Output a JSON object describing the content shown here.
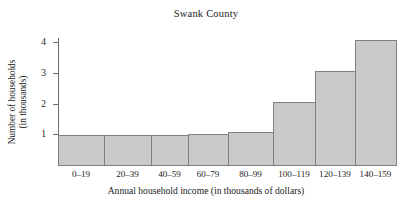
{
  "chart_data": {
    "type": "bar",
    "title": "Swank County",
    "xlabel": "Annual household income (in thousands of dollars)",
    "ylabel_line1": "Number of households",
    "ylabel_line2": "(in thousands)",
    "categories": [
      "0–19",
      "20–39",
      "40–59",
      "60–79",
      "80–99",
      "100–119",
      "120–139",
      "140–159"
    ],
    "values": [
      1.0,
      1.0,
      1.0,
      1.05,
      1.1,
      2.1,
      3.1,
      4.1
    ],
    "bar_widths": [
      46,
      47,
      37,
      40,
      45,
      42,
      40,
      41
    ],
    "ytick_labels": [
      "1",
      "2",
      "3",
      "4"
    ],
    "ytick_values": [
      1,
      2,
      3,
      4
    ],
    "ylim": [
      0,
      4.4
    ],
    "xlim_note": "adjacent histogram bars, no gaps",
    "grid": false,
    "legend": "none",
    "bar_fill": "#c9c9c9",
    "bar_edge": "#808080",
    "axis_color": "#6e6e6e",
    "background": "#ffffff"
  }
}
